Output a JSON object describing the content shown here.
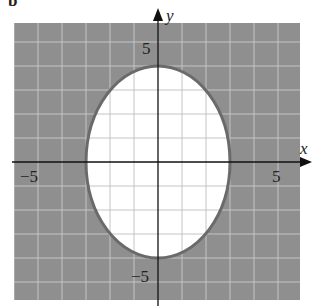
{
  "figure_label": "b",
  "chart_data": {
    "type": "region",
    "title": "",
    "xlabel": "x",
    "ylabel": "y",
    "xlim": [
      -6,
      6
    ],
    "ylim": [
      -6,
      6
    ],
    "grid": true,
    "grid_step": 1,
    "tick_labels": {
      "x": [
        {
          "value": -5,
          "label": "−5"
        },
        {
          "value": 5,
          "label": "5"
        }
      ],
      "y": [
        {
          "value": 5,
          "label": "5"
        },
        {
          "value": -5,
          "label": "−5"
        }
      ]
    },
    "boundary": {
      "shape": "ellipse",
      "equation": "x^2/9 + y^2/16 = 1",
      "center": [
        0,
        0
      ],
      "semi_axis_x": 3,
      "semi_axis_y": 4,
      "line_style": "solid"
    },
    "shaded_region": "outside ellipse (x^2/9 + y^2/16 >= 1)",
    "colors": {
      "shade": "#8f8f8f",
      "grid_on_shade": "#a8a8a8",
      "grid_on_white": "#cfcfcf",
      "boundary": "#6a6a6a",
      "axes": "#111111"
    }
  },
  "labels": {
    "x_axis": "x",
    "y_axis": "y",
    "x_neg5": "−5",
    "x_pos5": "5",
    "y_pos5": "5",
    "y_neg5": "−5"
  }
}
